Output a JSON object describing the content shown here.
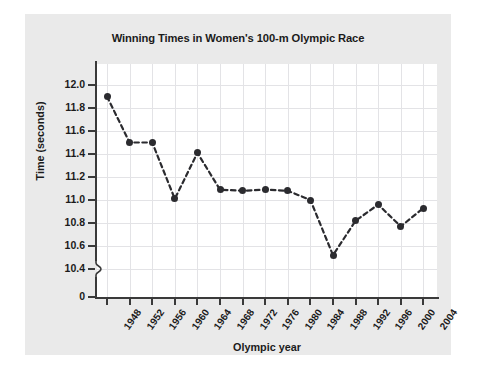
{
  "figure": {
    "title": "Winning Times in Women's 100-m Olympic Race",
    "xlabel": "Olympic year",
    "ylabel": "Time (seconds)",
    "background_color": "#eaeaea",
    "plot_background_color": "#ffffff",
    "marker_color": "#2b2b2f",
    "grid_color": "#e3e3e6",
    "axis_color": "#3a3a3a",
    "axis_break_label": "0"
  },
  "chart_data": {
    "type": "line",
    "title": "Winning Times in Women's 100-m Olympic Race",
    "xlabel": "Olympic year",
    "ylabel": "Time (seconds)",
    "grid": true,
    "legend": "none",
    "line_style": "dashed",
    "marker": "filled-circle",
    "axis_break": true,
    "ylim": [
      10.4,
      12.0
    ],
    "ytick_labels": [
      "12.0",
      "11.8",
      "11.6",
      "11.4",
      "11.2",
      "11.0",
      "10.8",
      "10.6",
      "10.4",
      "0"
    ],
    "yticks": [
      12.0,
      11.8,
      11.6,
      11.4,
      11.2,
      11.0,
      10.8,
      10.6,
      10.4,
      0
    ],
    "categories": [
      1948,
      1952,
      1956,
      1960,
      1964,
      1968,
      1972,
      1976,
      1980,
      1984,
      1988,
      1992,
      1996,
      2000,
      2004
    ],
    "xtick_labels": [
      "1948",
      "1952",
      "1956",
      "1960",
      "1964",
      "1968",
      "1972",
      "1976",
      "1980",
      "1984",
      "1988",
      "1992",
      "1996",
      "2000",
      "2004"
    ],
    "values": [
      11.9,
      11.5,
      11.5,
      11.01,
      11.41,
      11.09,
      11.08,
      11.09,
      11.08,
      11.0,
      10.52,
      10.82,
      10.96,
      10.77,
      10.93
    ]
  }
}
